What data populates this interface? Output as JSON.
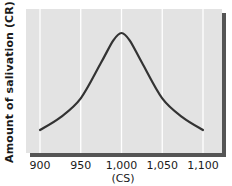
{
  "chart_data": {
    "type": "line",
    "title": "",
    "xlabel": "(CS)",
    "ylabel": "Amount of salivation (CR)",
    "x_ticks": [
      "900",
      "950",
      "1,000",
      "1,050",
      "1,100"
    ],
    "x_tick_values": [
      900,
      950,
      1000,
      1050,
      1100
    ],
    "xlim": [
      900,
      1100
    ],
    "y_ticks": [],
    "grid": {
      "vertical": true,
      "horizontal": false
    },
    "legend": null,
    "series": [
      {
        "name": "Generalization gradient",
        "x": [
          900,
          925,
          950,
          975,
          990,
          1000,
          1010,
          1025,
          1050,
          1075,
          1100
        ],
        "values": [
          0.08,
          0.2,
          0.38,
          0.72,
          0.93,
          1.0,
          0.93,
          0.72,
          0.38,
          0.2,
          0.08
        ],
        "note": "relative amount; y-axis has no numeric ticks"
      }
    ]
  },
  "colors": {
    "plot_background": "#e3e3e3",
    "shadow": "#555555",
    "grid": "#ffffff",
    "curve": "#333333",
    "text": "#1a1a1a"
  }
}
